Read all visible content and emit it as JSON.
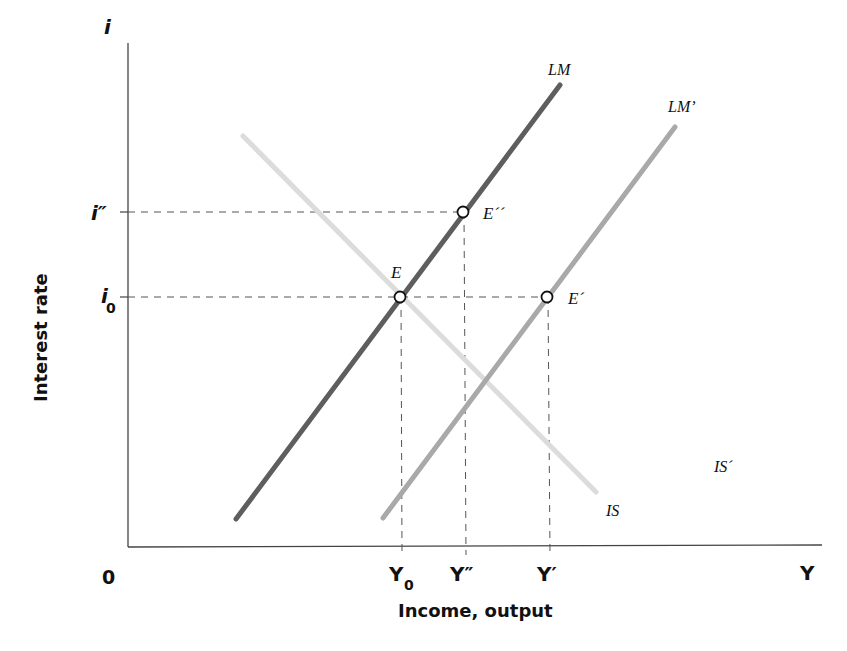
{
  "chart_data": {
    "type": "line",
    "title": "",
    "xlabel": "Income, output",
    "ylabel": "Interest rate",
    "x_axis_symbol": "Y",
    "y_axis_symbol": "i",
    "origin_label": "0",
    "x_ticks": [
      {
        "label": "Y",
        "sub": "0",
        "x": 402
      },
      {
        "label": "Y″",
        "sub": "",
        "x": 466
      },
      {
        "label": "Y′",
        "sub": "",
        "x": 550
      }
    ],
    "y_ticks": [
      {
        "label": "i″",
        "sub": "",
        "y": 212
      },
      {
        "label": "i",
        "sub": "0",
        "y": 297
      }
    ],
    "series": [
      {
        "name": "LM",
        "label": "LM",
        "color": "#5e5e5e",
        "width": 5,
        "points": [
          [
            236,
            519
          ],
          [
            560,
            85
          ]
        ]
      },
      {
        "name": "LM'",
        "label": "LM’",
        "color": "#a9a9a9",
        "width": 5,
        "points": [
          [
            383,
            518
          ],
          [
            675,
            127
          ]
        ]
      },
      {
        "name": "IS",
        "label": "IS",
        "color": "#dcdcdc",
        "width": 5,
        "points": [
          [
            243,
            136
          ],
          [
            596,
            492
          ]
        ]
      }
    ],
    "series_labels": [
      {
        "text": "LM",
        "x": 548,
        "y": 75
      },
      {
        "text": "LM’",
        "x": 668,
        "y": 112
      },
      {
        "text": "IS",
        "x": 606,
        "y": 516
      },
      {
        "text": "IS´",
        "x": 714,
        "y": 472
      }
    ],
    "equilibria": [
      {
        "name": "E",
        "label": "E",
        "x": 400,
        "y": 297,
        "label_x": 391,
        "label_y": 278
      },
      {
        "name": "E''",
        "label": "E´´",
        "x": 463,
        "y": 212,
        "label_x": 483,
        "label_y": 219
      },
      {
        "name": "E'",
        "label": "E´",
        "x": 547,
        "y": 297,
        "label_x": 568,
        "label_y": 304
      }
    ],
    "axes": {
      "origin": [
        128,
        547
      ],
      "x_end": 822,
      "y_top": 43
    },
    "grid": false,
    "legend": "none (inline labels)"
  }
}
